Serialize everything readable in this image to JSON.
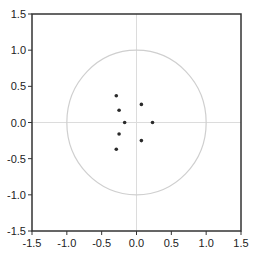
{
  "chart_data": {
    "type": "scatter",
    "title": "",
    "xlabel": "",
    "ylabel": "",
    "xlim": [
      -1.5,
      1.5
    ],
    "ylim": [
      -1.5,
      1.5
    ],
    "grid": false,
    "legend": null,
    "x_ticks": [
      "-1.5",
      "-1.0",
      "-0.5",
      "0.0",
      "0.5",
      "1.0",
      "1.5"
    ],
    "y_ticks": [
      "1.5",
      "1.0",
      "0.5",
      "0.0",
      "-0.5",
      "-1.0",
      "-1.5"
    ],
    "reference_lines": {
      "x": 0,
      "y": 0
    },
    "unit_circle": {
      "center": [
        0,
        0
      ],
      "radius": 1
    },
    "series": [
      {
        "name": "points",
        "points": [
          {
            "x": -0.29,
            "y": 0.37
          },
          {
            "x": -0.25,
            "y": 0.17
          },
          {
            "x": -0.17,
            "y": 0.0
          },
          {
            "x": -0.25,
            "y": -0.16
          },
          {
            "x": -0.29,
            "y": -0.37
          },
          {
            "x": 0.07,
            "y": 0.25
          },
          {
            "x": 0.23,
            "y": 0.0
          },
          {
            "x": 0.07,
            "y": -0.25
          }
        ]
      }
    ]
  },
  "colors": {
    "axis": "#333333",
    "circle": "#cfcfcf",
    "refline": "#dcdcdc",
    "point": "#2a2a2a"
  }
}
